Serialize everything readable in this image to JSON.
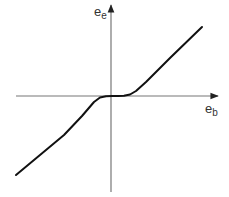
{
  "diagram": {
    "type": "transfer-characteristic",
    "axes": {
      "x": {
        "label_base": "e",
        "label_sub": "b"
      },
      "y": {
        "label_base": "e",
        "label_sub": "e"
      }
    },
    "colors": {
      "axis": "#777777",
      "curve": "#111111",
      "text": "#333333"
    },
    "curve_points": [
      [
        16,
        175
      ],
      [
        40,
        155
      ],
      [
        64,
        135
      ],
      [
        82,
        116
      ],
      [
        94,
        102
      ],
      [
        100,
        97.5
      ],
      [
        106,
        96.2
      ],
      [
        112,
        96
      ],
      [
        118,
        96
      ],
      [
        124,
        95.8
      ],
      [
        130,
        94.5
      ],
      [
        136,
        91
      ],
      [
        146,
        82
      ],
      [
        170,
        58
      ],
      [
        202,
        27
      ]
    ]
  }
}
